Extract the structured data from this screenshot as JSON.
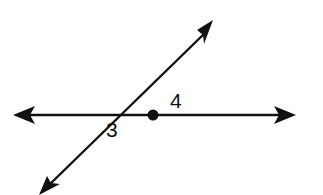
{
  "diagram": {
    "type": "intersecting lines with angles",
    "lines": [
      {
        "name": "horizontal-line",
        "from": [
          14,
          115
        ],
        "to": [
          295,
          115
        ],
        "arrows": "both"
      },
      {
        "name": "oblique-line",
        "from": [
          40,
          193
        ],
        "to": [
          212,
          22
        ],
        "arrows": "both"
      }
    ],
    "intersection_point": [
      153,
      115
    ],
    "angles": [
      {
        "label": "4",
        "position": "between upper-right ray and right horizontal ray"
      },
      {
        "label": "3",
        "position": "between left horizontal ray and lower-left ray"
      }
    ],
    "colors": {
      "stroke": "#111111",
      "background": "#ffffff"
    }
  }
}
